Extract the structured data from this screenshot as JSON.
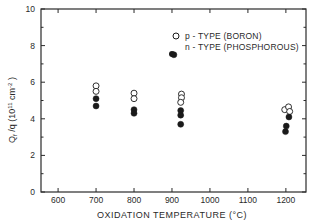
{
  "chart_data": {
    "type": "scatter",
    "title": "",
    "xlabel": "OXIDATION TEMPERATURE (°C)",
    "ylabel": "Q_f / q (10^11 cm^-2)",
    "ylabel_parts": {
      "main": "Q",
      "sub": "f",
      "rest": " /q  (10",
      "sup1": "11",
      "unit": " cm",
      "sup2": "-2",
      "close": " )"
    },
    "xlim": [
      555,
      1253
    ],
    "ylim": [
      0,
      10
    ],
    "x_ticks": [
      600,
      700,
      800,
      900,
      1000,
      1100,
      1200
    ],
    "x_tick_labels": [
      "600",
      "700",
      "800",
      "900",
      "1000",
      "1100",
      "1200"
    ],
    "y_ticks": [
      0,
      2,
      4,
      6,
      8,
      10
    ],
    "y_tick_labels": [
      "0",
      "2",
      "4",
      "6",
      "8",
      "10"
    ],
    "y_minor_ticks": [
      1,
      3,
      5,
      7,
      9
    ],
    "grid": false,
    "legend_position": "upper right",
    "series": [
      {
        "name": "p - TYPE (BORON)",
        "marker": "open-circle",
        "points": [
          {
            "x": 700,
            "y": 5.8
          },
          {
            "x": 700,
            "y": 5.5
          },
          {
            "x": 800,
            "y": 5.4
          },
          {
            "x": 800,
            "y": 5.1
          },
          {
            "x": 925,
            "y": 5.35
          },
          {
            "x": 925,
            "y": 5.15
          },
          {
            "x": 923,
            "y": 4.9
          },
          {
            "x": 1197,
            "y": 4.5
          },
          {
            "x": 1207,
            "y": 4.65
          },
          {
            "x": 1210,
            "y": 4.4
          }
        ]
      },
      {
        "name": "n - TYPE (PHOSPHOROUS)",
        "marker": "filled-circle",
        "points": [
          {
            "x": 700,
            "y": 5.1
          },
          {
            "x": 700,
            "y": 4.7
          },
          {
            "x": 800,
            "y": 4.5
          },
          {
            "x": 800,
            "y": 4.3
          },
          {
            "x": 905,
            "y": 7.5
          },
          {
            "x": 923,
            "y": 4.45
          },
          {
            "x": 923,
            "y": 4.2
          },
          {
            "x": 923,
            "y": 3.7
          },
          {
            "x": 1208,
            "y": 4.1
          },
          {
            "x": 1201,
            "y": 3.6
          },
          {
            "x": 1199,
            "y": 3.3
          }
        ]
      }
    ]
  },
  "colors": {
    "axis": "#2a2a2a",
    "marker": "#1a1a1a",
    "background": "#ffffff"
  }
}
